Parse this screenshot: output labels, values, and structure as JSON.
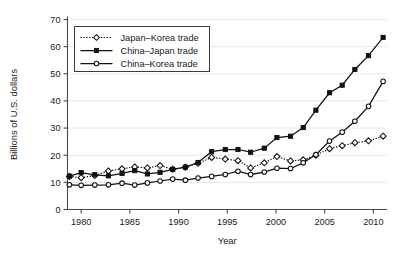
{
  "chart_data": {
    "type": "line",
    "title": "",
    "xlabel": "Year",
    "ylabel": "Billions of  U.S. dollars",
    "xlim": [
      1978.6,
      2011.4
    ],
    "ylim": [
      0,
      70
    ],
    "xticks": [
      1980,
      1985,
      1990,
      1995,
      2000,
      2005,
      2010
    ],
    "xtick_labels": [
      "1980",
      "1985",
      "1990",
      "1995",
      "2000",
      "2005",
      "2010"
    ],
    "yticks": [
      0,
      10,
      20,
      30,
      40,
      50,
      60,
      70
    ],
    "ytick_labels": [
      "0",
      "10",
      "20",
      "30",
      "40",
      "50",
      "60",
      "70"
    ],
    "grid": "horizontal",
    "legend_position": "upper-left",
    "series": [
      {
        "name": "Japan–Korea trade",
        "marker": "open-diamond",
        "line_style": "dotted",
        "color": "#111111",
        "x": [
          1978.8,
          1980.0,
          1981.4,
          1982.8,
          1984.2,
          1985.5,
          1986.8,
          1988.1,
          1989.4,
          1990.7,
          1992.0,
          1993.4,
          1994.8,
          1996.1,
          1997.4,
          1998.8,
          2000.1,
          2001.5,
          2002.8,
          2004.1,
          2005.5,
          2006.8,
          2008.1,
          2009.5,
          2011.0
        ],
        "y": [
          12.2,
          11.7,
          12.5,
          14.2,
          15.0,
          15.7,
          15.3,
          16.2,
          14.8,
          15.6,
          17.0,
          19.2,
          18.6,
          18.0,
          15.3,
          17.2,
          19.5,
          17.9,
          18.3,
          20.0,
          22.4,
          23.5,
          24.6,
          25.3,
          27.0
        ]
      },
      {
        "name": "China–Japan trade",
        "marker": "filled-square",
        "line_style": "solid",
        "color": "#111111",
        "x": [
          1978.8,
          1980.0,
          1981.4,
          1982.8,
          1984.2,
          1985.5,
          1986.8,
          1988.1,
          1989.4,
          1990.7,
          1992.0,
          1993.4,
          1994.8,
          1996.1,
          1997.4,
          1998.8,
          2000.1,
          2001.5,
          2002.8,
          2004.1,
          2005.5,
          2006.8,
          2008.1,
          2009.5,
          2011.0
        ],
        "y": [
          12.3,
          13.6,
          12.8,
          12.4,
          13.3,
          14.3,
          13.1,
          13.7,
          14.8,
          15.6,
          17.3,
          21.3,
          22.1,
          22.1,
          21.1,
          22.6,
          26.5,
          27.0,
          30.2,
          36.6,
          43.0,
          45.8,
          51.6,
          56.7,
          63.4
        ]
      },
      {
        "name": "China–Korea trade",
        "marker": "open-circle",
        "line_style": "solid",
        "color": "#111111",
        "x": [
          1978.8,
          1980.0,
          1981.4,
          1982.8,
          1984.2,
          1985.5,
          1986.8,
          1988.1,
          1989.4,
          1990.7,
          1992.0,
          1993.4,
          1994.8,
          1996.1,
          1997.4,
          1998.8,
          2000.1,
          2001.5,
          2002.8,
          2004.1,
          2005.5,
          2006.8,
          2008.1,
          2009.5,
          2011.0
        ],
        "y": [
          9.1,
          8.9,
          9.0,
          9.1,
          9.7,
          9.0,
          9.8,
          10.5,
          11.2,
          10.8,
          11.6,
          12.2,
          12.9,
          14.1,
          12.9,
          13.8,
          15.2,
          15.1,
          17.2,
          20.2,
          25.2,
          28.5,
          32.5,
          38.0,
          47.2
        ]
      }
    ]
  }
}
